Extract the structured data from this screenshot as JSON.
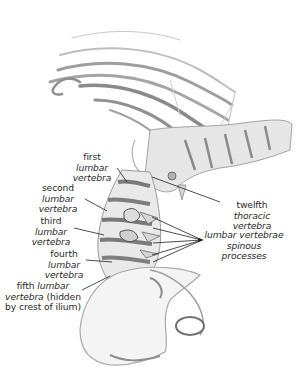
{
  "figure": {
    "colors": {
      "background": "#ffffff",
      "text": "#2a2a2a",
      "leader_line": "#1e1e1e",
      "bone_light": "#e2e2e2",
      "bone_shade": "#8c8c8c"
    },
    "labels": {
      "first": {
        "line1_plain": "first ",
        "line1_italic": "lumbar",
        "line2_italic": "vertebra"
      },
      "second": {
        "line1_plain": "second ",
        "line1_italic": "lumbar",
        "line2_italic": "vertebra"
      },
      "third": {
        "line1_plain": "third ",
        "line1_italic": "lumbar",
        "line2_italic": "vertebra"
      },
      "fourth": {
        "line1_plain": "fourth ",
        "line1_italic": "lumbar",
        "line2_italic": "vertebra"
      },
      "fifth": {
        "line1_plain": "fifth ",
        "line1_italic": "lumbar",
        "line2_italic": "vertebra",
        "line2_plain": " (hidden",
        "line3_plain": "by crest of ilium)"
      },
      "twelfth_thoracic": {
        "line1_plain": "twelfth ",
        "line1_italic": "thoracic",
        "line2_italic": "vertebra"
      },
      "spinous": {
        "line1_italic": "lumbar vertebrae",
        "line2_italic": "spinous processes"
      }
    }
  }
}
